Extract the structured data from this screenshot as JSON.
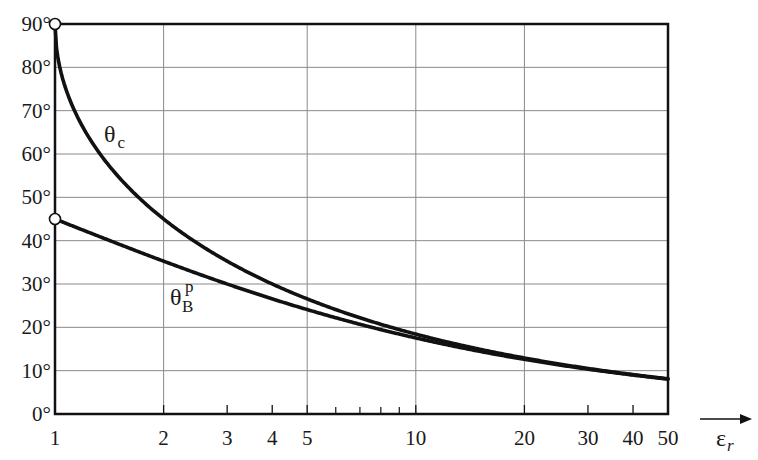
{
  "chart_data": {
    "type": "line",
    "title": "",
    "xlabel": "ε_r",
    "ylabel": "",
    "xscale": "log",
    "xlim": [
      1,
      50
    ],
    "ylim": [
      0,
      90
    ],
    "grid": true,
    "x_ticks": [
      1,
      2,
      3,
      4,
      5,
      10,
      20,
      30,
      40,
      50
    ],
    "x_tick_labels": [
      "1",
      "2",
      "3",
      "4",
      "5",
      "10",
      "20",
      "30",
      "40",
      "50"
    ],
    "x_minor_ticks": [
      6,
      7,
      8,
      9
    ],
    "x_gridlines": [
      2,
      5,
      10,
      20
    ],
    "y_ticks": [
      0,
      10,
      20,
      30,
      40,
      50,
      60,
      70,
      80,
      90
    ],
    "y_tick_labels": [
      "0°",
      "10°",
      "20°",
      "30°",
      "40°",
      "50°",
      "60°",
      "70°",
      "80°",
      "90°"
    ],
    "series": [
      {
        "name": "θc",
        "label_main": "θ",
        "label_sub": "c",
        "x": [
          1,
          1.2,
          1.5,
          2,
          3,
          4,
          5,
          10,
          20,
          30,
          40,
          50
        ],
        "values": [
          90,
          65.9,
          54.7,
          45.0,
          35.3,
          30.0,
          26.6,
          18.4,
          12.9,
          10.5,
          9.1,
          8.1
        ]
      },
      {
        "name": "θB^p",
        "label_main": "θ",
        "label_sub": "B",
        "label_sup": "p",
        "x": [
          1,
          1.2,
          1.5,
          2,
          3,
          4,
          5,
          10,
          20,
          30,
          40,
          50
        ],
        "values": [
          45.0,
          42.4,
          39.2,
          35.3,
          30.0,
          26.6,
          24.1,
          17.5,
          12.6,
          10.3,
          9.0,
          8.0
        ]
      }
    ],
    "markers": [
      {
        "x": 1,
        "y": 90,
        "style": "open-circle"
      },
      {
        "x": 1,
        "y": 45,
        "style": "open-circle"
      }
    ],
    "axis_arrow_label": "ε",
    "axis_arrow_label_sub": "r"
  }
}
